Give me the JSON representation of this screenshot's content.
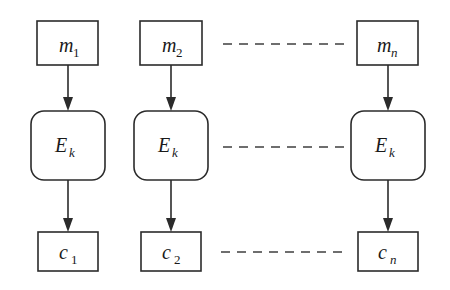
{
  "diagram": {
    "colors": {
      "stroke": "#2b2b2b",
      "dashed": "#6e6e6e",
      "background": "#ffffff",
      "text": "#1a1a1a"
    },
    "columns": [
      {
        "id": "col-1",
        "message": {
          "base": "m",
          "sub": "1",
          "sub_style": "normal"
        },
        "cipher_fn": {
          "base": "E",
          "sub": "k",
          "sub_style": "italic"
        },
        "ciphertext": {
          "base": "c",
          "sub": "1",
          "sub_style": "normal"
        }
      },
      {
        "id": "col-2",
        "message": {
          "base": "m",
          "sub": "2",
          "sub_style": "normal"
        },
        "cipher_fn": {
          "base": "E",
          "sub": "k",
          "sub_style": "italic"
        },
        "ciphertext": {
          "base": "c",
          "sub": "2",
          "sub_style": "normal"
        }
      },
      {
        "id": "col-n",
        "message": {
          "base": "m",
          "sub": "n",
          "sub_style": "italic"
        },
        "cipher_fn": {
          "base": "E",
          "sub": "k",
          "sub_style": "italic"
        },
        "ciphertext": {
          "base": "c",
          "sub": "n",
          "sub_style": "italic"
        }
      }
    ],
    "ellipsis_rows": [
      {
        "id": "ellipsis-messages",
        "label": "dashed-continuation"
      },
      {
        "id": "ellipsis-ciphers",
        "label": "dashed-continuation"
      },
      {
        "id": "ellipsis-ciphertexts",
        "label": "dashed-continuation"
      }
    ]
  }
}
